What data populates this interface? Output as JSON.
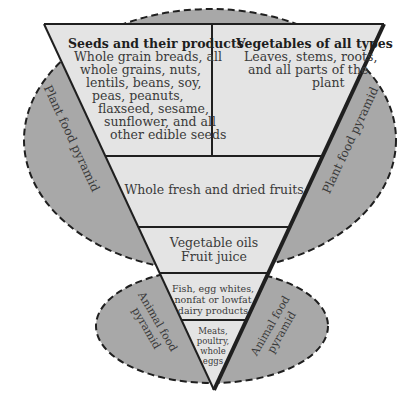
{
  "colors": {
    "background": "#ffffff",
    "ellipse_fill": "#a8a8a8",
    "triangle_fill": "#e4e4e4",
    "stroke": "#1f1f1f",
    "text": "#3a3a3a"
  },
  "plant_ellipse": {
    "label_left": "Plant food pyramid",
    "label_right": "Plant food pyramid"
  },
  "animal_ellipse": {
    "label_left_line1": "Animal food",
    "label_left_line2": "pyramid",
    "label_right_line1": "Animal food",
    "label_right_line2": "pyramid"
  },
  "sections": {
    "seeds": {
      "title": "Seeds and their products",
      "lines": [
        "Whole grain breads, all",
        "whole grains, nuts,",
        "lentils, beans, soy,",
        "peas, peanuts,",
        "flaxseed, sesame,",
        "sunflower, and all",
        "other edible seeds"
      ]
    },
    "vegetables": {
      "title": "Vegetables of all types",
      "lines": [
        "Leaves, stems, roots,",
        "and all parts of the",
        "plant"
      ]
    },
    "fruits": {
      "lines": [
        "Whole fresh and dried fruits"
      ]
    },
    "oils": {
      "lines": [
        "Vegetable oils",
        "Fruit juice"
      ]
    },
    "fish_dairy": {
      "lines": [
        "Fish, egg whites,",
        "nonfat or lowfat",
        "dairy products"
      ]
    },
    "meats": {
      "lines": [
        "Meats,",
        "poultry,",
        "whole",
        "eggs"
      ]
    }
  }
}
